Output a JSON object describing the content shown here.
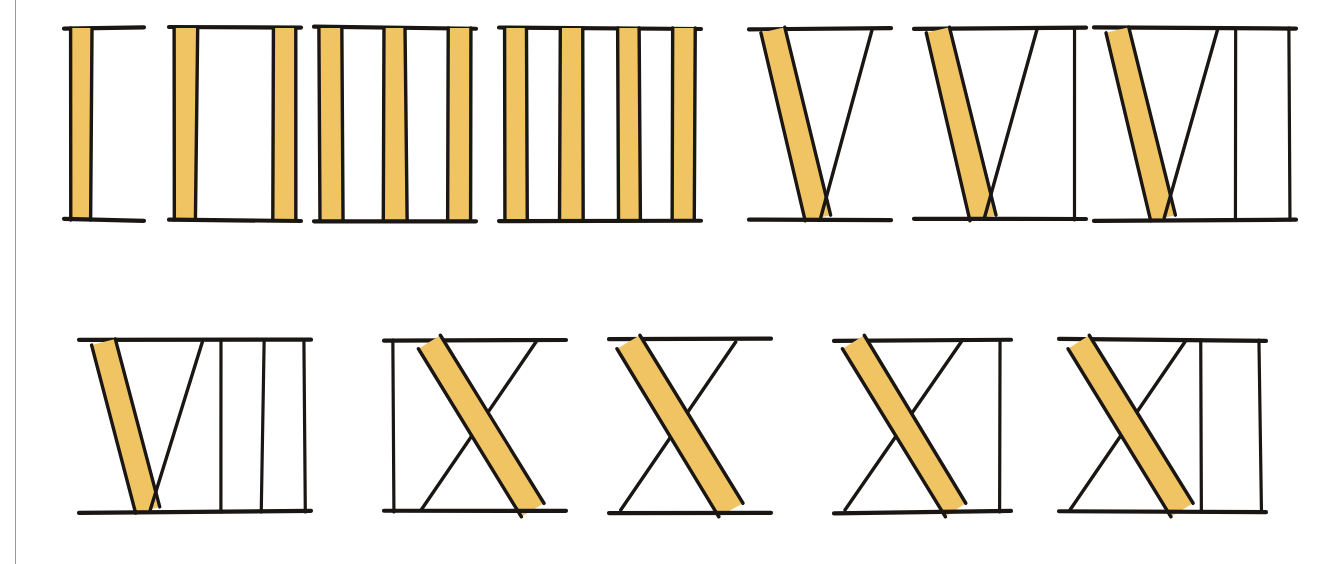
{
  "page": {
    "kind": "scanned-illustration",
    "background_color": "#ffffff",
    "border_line_color": "#9a9a9a",
    "ink_color": "#1a1613",
    "fill_color": "#f0c462",
    "fill_color_light": "#f7d98e",
    "fill_color_dark": "#e0ad49"
  },
  "legend": {
    "stroke_types": [
      {
        "name": "filled-stroke",
        "description": "thick stroke filled with yellow-ochre color pencil",
        "color": "#f0c462"
      },
      {
        "name": "outline-stroke",
        "description": "thin stroke drawn in black ink only",
        "color": "#1a1613"
      },
      {
        "name": "serif-bar",
        "description": "horizontal serif line at top and bottom of each numeral",
        "color": "#1a1613"
      }
    ]
  },
  "rows": [
    {
      "row_index": 0,
      "numerals": [
        {
          "id": "numeral-1",
          "label": "I",
          "value": 1,
          "shape": "bars",
          "filled_bars": 1,
          "outline_bars": 0,
          "x": 70,
          "y": 28,
          "w": 68,
          "h": 192
        },
        {
          "id": "numeral-2",
          "label": "II",
          "value": 2,
          "shape": "bars",
          "filled_bars": 2,
          "outline_bars": 0,
          "x": 175,
          "y": 28,
          "w": 120,
          "h": 192
        },
        {
          "id": "numeral-3",
          "label": "III",
          "value": 3,
          "shape": "bars",
          "filled_bars": 3,
          "outline_bars": 0,
          "x": 320,
          "y": 28,
          "w": 150,
          "h": 192
        },
        {
          "id": "numeral-4",
          "label": "IIII",
          "value": 4,
          "shape": "bars",
          "filled_bars": 4,
          "outline_bars": 0,
          "x": 505,
          "y": 28,
          "w": 190,
          "h": 192
        },
        {
          "id": "numeral-5",
          "label": "V",
          "value": 5,
          "shape": "v",
          "filled_bars": 0,
          "outline_bars": 0,
          "x": 755,
          "y": 28,
          "w": 130,
          "h": 192
        },
        {
          "id": "numeral-6",
          "label": "VI",
          "value": 6,
          "shape": "v",
          "filled_bars": 0,
          "outline_bars": 1,
          "x": 920,
          "y": 28,
          "w": 160,
          "h": 192
        },
        {
          "id": "numeral-7",
          "label": "VII",
          "value": 7,
          "shape": "v",
          "filled_bars": 0,
          "outline_bars": 2,
          "x": 1100,
          "y": 28,
          "w": 190,
          "h": 192
        }
      ]
    },
    {
      "row_index": 1,
      "numerals": [
        {
          "id": "numeral-8",
          "label": "VIII",
          "value": 8,
          "shape": "v",
          "filled_bars": 0,
          "outline_bars": 3,
          "x": 85,
          "y": 340,
          "w": 220,
          "h": 172
        },
        {
          "id": "numeral-9",
          "label": "IX",
          "value": 9,
          "shape": "ix",
          "filled_bars": 0,
          "outline_bars": 1,
          "x": 390,
          "y": 340,
          "w": 170,
          "h": 172
        },
        {
          "id": "numeral-10",
          "label": "X",
          "value": 10,
          "shape": "x",
          "filled_bars": 0,
          "outline_bars": 0,
          "x": 615,
          "y": 340,
          "w": 150,
          "h": 172
        },
        {
          "id": "numeral-11",
          "label": "XI",
          "value": 11,
          "shape": "x",
          "filled_bars": 0,
          "outline_bars": 1,
          "x": 840,
          "y": 340,
          "w": 165,
          "h": 172
        },
        {
          "id": "numeral-12",
          "label": "XII",
          "value": 12,
          "shape": "x",
          "filled_bars": 0,
          "outline_bars": 2,
          "x": 1065,
          "y": 340,
          "w": 195,
          "h": 172
        }
      ]
    }
  ]
}
